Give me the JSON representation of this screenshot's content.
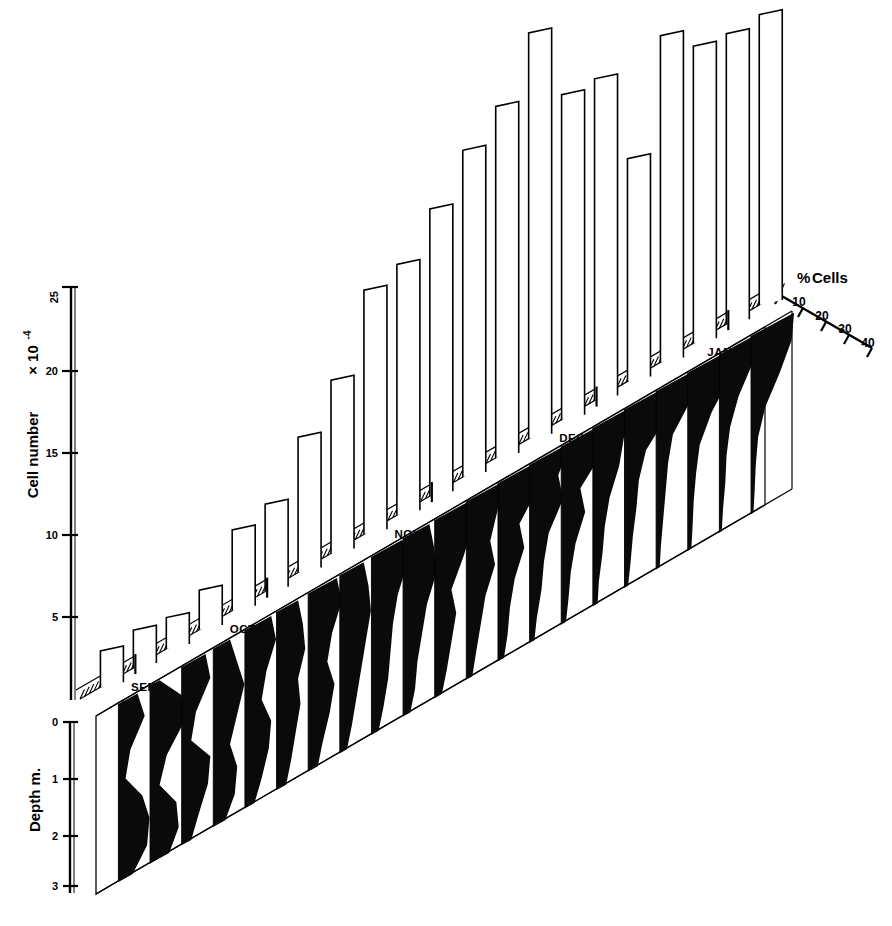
{
  "figure": {
    "type": "3d-combination-chart",
    "background": "#ffffff",
    "ink": "#000000"
  },
  "axes": {
    "cell_number": {
      "title": "Cell number",
      "multiplier": "× 10",
      "exponent": "-4",
      "ticks": [
        "5",
        "10",
        "15",
        "20",
        "25"
      ],
      "tick_values": [
        5,
        10,
        15,
        20,
        25
      ],
      "min": 0,
      "max": 25
    },
    "depth": {
      "title": "Depth m.",
      "ticks": [
        "0",
        "1",
        "2",
        "3"
      ],
      "tick_values": [
        0,
        1,
        2,
        3
      ],
      "min": 0,
      "max": 3.4
    },
    "percent_cells": {
      "title": "% Cells",
      "title_symbol": "%",
      "title_word": "Cells",
      "ticks": [
        "0",
        "10",
        "20",
        "30",
        "40"
      ],
      "tick_values": [
        0,
        10,
        20,
        30,
        40
      ],
      "min": 0,
      "max": 40
    },
    "time": {
      "months": [
        "SEPT",
        "OCT",
        "NOV",
        "DEC",
        "JAN"
      ],
      "month_positions": [
        0.5,
        3.5,
        8.5,
        13.5,
        18.0
      ]
    }
  },
  "chart_data": {
    "type": "bar",
    "xlabel": "",
    "ylabel": "Cell number × 10-4",
    "ylim": [
      0,
      25
    ],
    "grid": false,
    "legend": "none",
    "categories": [
      "1",
      "2",
      "3",
      "4",
      "5",
      "6",
      "7",
      "8",
      "9",
      "10",
      "11",
      "12",
      "13",
      "14",
      "15",
      "16",
      "17",
      "18",
      "19",
      "20",
      "21"
    ],
    "month_of_sample": [
      "SEPT",
      "SEPT",
      "OCT",
      "OCT",
      "OCT",
      "OCT",
      "NOV",
      "NOV",
      "NOV",
      "NOV",
      "NOV",
      "DEC",
      "DEC",
      "DEC",
      "DEC",
      "DEC",
      "JAN",
      "JAN",
      "JAN",
      "JAN",
      "JAN"
    ],
    "values": [
      2.2,
      2.3,
      1.9,
      2.4,
      4.9,
      5.3,
      8.2,
      10.5,
      14.8,
      15.2,
      17.4,
      19.8,
      21.3,
      24.6,
      19.7,
      19.5,
      13.5,
      19.8,
      18.0,
      17.6,
      17.6
    ],
    "series": [
      {
        "name": "Cell number × 10-4",
        "values": [
          2.2,
          2.3,
          1.9,
          2.4,
          4.9,
          5.3,
          8.2,
          10.5,
          14.8,
          15.2,
          17.4,
          19.8,
          21.3,
          24.6,
          19.7,
          19.5,
          13.5,
          19.8,
          18.0,
          17.6,
          17.6
        ]
      }
    ],
    "secondary": {
      "type": "area",
      "name": "% Cells by depth",
      "xlabel": "% Cells",
      "ylabel": "Depth m.",
      "xlim": [
        0,
        40
      ],
      "ylim": [
        0,
        3.4
      ],
      "depths": [
        0,
        0.5,
        1.0,
        1.5,
        2.0,
        2.5,
        3.0,
        3.4
      ],
      "profiles": [
        {
          "sample": 1,
          "month": "SEPT",
          "percent": [
            16,
            22,
            10,
            6,
            20,
            26,
            24,
            12
          ]
        },
        {
          "sample": 2,
          "month": "SEPT",
          "percent": [
            8,
            26,
            30,
            14,
            8,
            22,
            24,
            16
          ]
        },
        {
          "sample": 3,
          "month": "OCT",
          "percent": [
            20,
            24,
            12,
            8,
            24,
            22,
            14,
            8
          ]
        },
        {
          "sample": 4,
          "month": "OCT",
          "percent": [
            14,
            20,
            26,
            20,
            14,
            20,
            18,
            10
          ]
        },
        {
          "sample": 5,
          "month": "OCT",
          "percent": [
            22,
            26,
            18,
            14,
            22,
            20,
            14,
            8
          ]
        },
        {
          "sample": 6,
          "month": "OCT",
          "percent": [
            18,
            22,
            24,
            18,
            20,
            16,
            12,
            8
          ]
        },
        {
          "sample": 7,
          "month": "NOV",
          "percent": [
            24,
            28,
            20,
            16,
            22,
            18,
            12,
            8
          ]
        },
        {
          "sample": 8,
          "month": "NOV",
          "percent": [
            20,
            24,
            26,
            22,
            18,
            14,
            10,
            6
          ]
        },
        {
          "sample": 9,
          "month": "NOV",
          "percent": [
            26,
            30,
            22,
            18,
            16,
            14,
            10,
            6
          ]
        },
        {
          "sample": 10,
          "month": "NOV",
          "percent": [
            22,
            26,
            28,
            20,
            16,
            12,
            10,
            6
          ]
        },
        {
          "sample": 11,
          "month": "NOV",
          "percent": [
            28,
            32,
            24,
            14,
            18,
            14,
            10,
            6
          ]
        },
        {
          "sample": 12,
          "month": "DEC",
          "percent": [
            30,
            26,
            20,
            24,
            16,
            12,
            8,
            5
          ]
        },
        {
          "sample": 13,
          "month": "DEC",
          "percent": [
            26,
            34,
            18,
            22,
            14,
            10,
            8,
            5
          ]
        },
        {
          "sample": 14,
          "month": "DEC",
          "percent": [
            34,
            24,
            28,
            16,
            12,
            10,
            6,
            4
          ]
        },
        {
          "sample": 15,
          "month": "DEC",
          "percent": [
            30,
            36,
            16,
            20,
            12,
            8,
            6,
            4
          ]
        },
        {
          "sample": 16,
          "month": "DEC",
          "percent": [
            36,
            26,
            22,
            14,
            10,
            8,
            5,
            4
          ]
        },
        {
          "sample": 17,
          "month": "JAN",
          "percent": [
            32,
            38,
            18,
            12,
            10,
            7,
            5,
            3
          ]
        },
        {
          "sample": 18,
          "month": "JAN",
          "percent": [
            38,
            30,
            14,
            10,
            8,
            6,
            4,
            3
          ]
        },
        {
          "sample": 19,
          "month": "JAN",
          "percent": [
            34,
            36,
            20,
            10,
            7,
            5,
            4,
            3
          ]
        },
        {
          "sample": 20,
          "month": "JAN",
          "percent": [
            40,
            28,
            16,
            9,
            6,
            5,
            3,
            2
          ]
        },
        {
          "sample": 21,
          "month": "JAN",
          "percent": [
            36,
            34,
            24,
            12,
            6,
            4,
            3,
            2
          ]
        }
      ]
    }
  }
}
